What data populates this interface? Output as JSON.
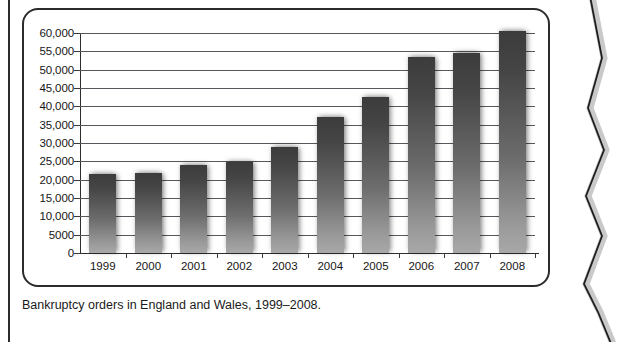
{
  "figure": {
    "caption": "Bankruptcy orders in England and Wales, 1999–2008."
  },
  "chart_data": {
    "type": "bar",
    "title": "",
    "xlabel": "",
    "ylabel": "",
    "categories": [
      "1999",
      "2000",
      "2001",
      "2002",
      "2003",
      "2004",
      "2005",
      "2006",
      "2007",
      "2008"
    ],
    "values": [
      21500,
      21800,
      24000,
      24800,
      29000,
      37000,
      42500,
      53500,
      54500,
      60500
    ],
    "ylim": [
      0,
      60000
    ],
    "ytick_values": [
      0,
      5000,
      10000,
      15000,
      20000,
      25000,
      30000,
      35000,
      40000,
      45000,
      50000,
      55000,
      60000
    ],
    "ytick_labels": [
      "0",
      "5000",
      "10,000",
      "15,000",
      "20,000",
      "25,000",
      "30,000",
      "35,000",
      "40,000",
      "45,000",
      "50,000",
      "55,000",
      "60,000"
    ],
    "grid": true,
    "legend": null,
    "bar_color_top": "#3c3c3c",
    "bar_color_bottom": "#a8a8a8",
    "axis_color": "#2e2e2e",
    "gridline_color": "#55585c"
  }
}
